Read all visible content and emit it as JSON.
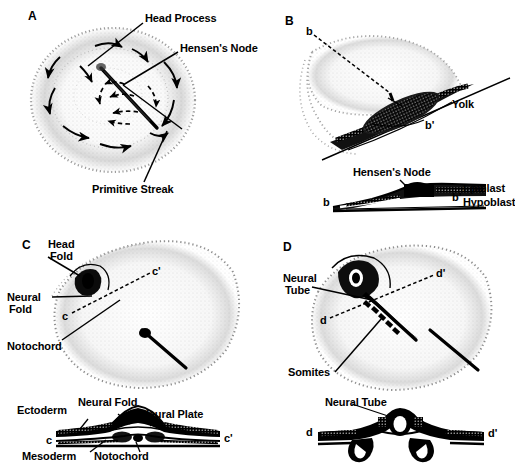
{
  "figure": {
    "background": "#ffffff",
    "ink": "#000000",
    "stipple": "#6b6b6b"
  },
  "panels": [
    {
      "id": "A",
      "letter": "A",
      "caption_labels": [
        "Head Process",
        "Hensen's Node",
        "Primitive Streak"
      ],
      "description": "Dorsal view of blastoderm with cell migration arrows converging on the primitive streak"
    },
    {
      "id": "B",
      "letter": "B",
      "caption_labels": [
        "Yolk",
        "Hensen's Node",
        "Epiblast",
        "Hypoblast"
      ],
      "section_marks": [
        "b",
        "b'"
      ],
      "description": "Blastoderm on yolk with section plane b-b' and corresponding cross-section"
    },
    {
      "id": "C",
      "letter": "C",
      "caption_labels": [
        "Head Fold",
        "Neural Fold",
        "Notochord",
        "Ectoderm",
        "Neural Plate",
        "Mesoderm"
      ],
      "section_marks": [
        "c",
        "c'"
      ],
      "description": "Neural plate stage embryo with section plane c-c' and transverse section"
    },
    {
      "id": "D",
      "letter": "D",
      "caption_labels": [
        "Neural Tube",
        "Somites"
      ],
      "section_marks": [
        "d",
        "d'"
      ],
      "description": "Neurula stage embryo with section plane d-d' and transverse section through neural tube"
    }
  ],
  "labels": {
    "a_head_process": "Head Process",
    "a_hensens_node": "Hensen's Node",
    "a_primitive_streak": "Primitive Streak",
    "b_letter": "B",
    "b_mark": "b",
    "b_prime_mark": "b'",
    "b_yolk": "Yolk",
    "b_hensens_node": "Hensen's Node",
    "b_sec_b": "b",
    "b_sec_bprime": "b'",
    "b_epiblast": "Epiblast",
    "b_hypoblast": "Hypoblast",
    "c_letter": "C",
    "c_head_fold_1": "Head",
    "c_head_fold_2": "Fold",
    "c_neural_fold_1": "Neural",
    "c_neural_fold_2": "Fold",
    "c_notochord": "Notochord",
    "c_mark": "c",
    "c_prime_mark": "c'",
    "c_sec_c": "c",
    "c_sec_cprime": "c'",
    "c_ectoderm": "Ectoderm",
    "c_neural_fold_sec": "Neural Fold",
    "c_neural_plate": "Neural Plate",
    "c_mesoderm": "Mesoderm",
    "c_notochord_sec": "Notochord",
    "d_letter": "D",
    "d_neural_tube_1": "Neural",
    "d_neural_tube_2": "Tube",
    "d_somites": "Somites",
    "d_mark": "d",
    "d_prime_mark": "d'",
    "d_neural_tube_sec": "Neural Tube",
    "d_sec_d": "d",
    "d_sec_dprime": "d'",
    "a_letter": "A"
  }
}
